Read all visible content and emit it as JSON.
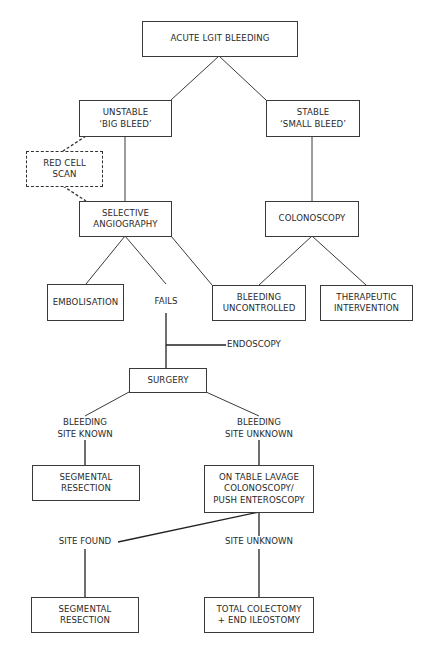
{
  "flowchart": {
    "root": {
      "lines": [
        "ACUTE LGIT BLEEDING"
      ]
    },
    "unstable": {
      "lines": [
        "UNSTABLE",
        "‘BIG BLEED’"
      ]
    },
    "stable": {
      "lines": [
        "STABLE",
        "‘SMALL BLEED’"
      ]
    },
    "red_cell_scan": {
      "lines": [
        "RED CELL",
        "SCAN"
      ],
      "style": "dashed"
    },
    "selective_angiography": {
      "lines": [
        "SELECTIVE",
        "ANGIOGRAPHY"
      ]
    },
    "colonoscopy": {
      "lines": [
        "COLONOSCOPY"
      ]
    },
    "embolisation": {
      "lines": [
        "EMBOLISATION"
      ]
    },
    "fails": {
      "lines": [
        "FAILS"
      ]
    },
    "bleeding_uncontrolled": {
      "lines": [
        "BLEEDING",
        "UNCONTROLLED"
      ]
    },
    "therapeutic_intervention": {
      "lines": [
        "THERAPEUTIC",
        "INTERVENTION"
      ]
    },
    "endoscopy": {
      "lines": [
        "ENDOSCOPY"
      ]
    },
    "surgery": {
      "lines": [
        "SURGERY"
      ]
    },
    "bleeding_site_known": {
      "lines": [
        "BLEEDING",
        "SITE KNOWN"
      ]
    },
    "bleeding_site_unknown": {
      "lines": [
        "BLEEDING",
        "SITE UNKNOWN"
      ]
    },
    "segmental_resection_1": {
      "lines": [
        "SEGMENTAL",
        "RESECTION"
      ]
    },
    "on_table_lavage": {
      "lines": [
        "ON TABLE LAVAGE",
        "COLONOSCOPY/",
        "PUSH ENTEROSCOPY"
      ]
    },
    "site_found": {
      "lines": [
        "SITE FOUND"
      ]
    },
    "site_unknown": {
      "lines": [
        "SITE UNKNOWN"
      ]
    },
    "segmental_resection_2": {
      "lines": [
        "SEGMENTAL",
        "RESECTION"
      ]
    },
    "total_colectomy": {
      "lines": [
        "TOTAL COLECTOMY",
        "+ END ILEOSTOMY"
      ]
    }
  },
  "edges": [
    [
      "root",
      "unstable"
    ],
    [
      "root",
      "stable"
    ],
    [
      "unstable",
      "red_cell_scan",
      "dashed"
    ],
    [
      "red_cell_scan",
      "selective_angiography",
      "dashed"
    ],
    [
      "unstable",
      "selective_angiography"
    ],
    [
      "stable",
      "colonoscopy"
    ],
    [
      "selective_angiography",
      "embolisation"
    ],
    [
      "selective_angiography",
      "fails"
    ],
    [
      "selective_angiography",
      "bleeding_uncontrolled"
    ],
    [
      "colonoscopy",
      "bleeding_uncontrolled"
    ],
    [
      "colonoscopy",
      "therapeutic_intervention"
    ],
    [
      "fails",
      "surgery"
    ],
    [
      "fails",
      "endoscopy"
    ],
    [
      "surgery",
      "bleeding_site_known"
    ],
    [
      "surgery",
      "bleeding_site_unknown"
    ],
    [
      "bleeding_site_known",
      "segmental_resection_1"
    ],
    [
      "bleeding_site_unknown",
      "on_table_lavage"
    ],
    [
      "on_table_lavage",
      "site_found"
    ],
    [
      "on_table_lavage",
      "site_unknown"
    ],
    [
      "site_found",
      "segmental_resection_2"
    ],
    [
      "site_unknown",
      "total_colectomy"
    ]
  ]
}
